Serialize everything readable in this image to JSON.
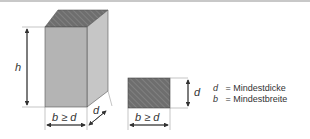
{
  "diagram": {
    "labels": {
      "height": "h",
      "width_front": "b ≥ d",
      "depth": "d",
      "section_depth": "d",
      "section_width": "b ≥ d"
    },
    "legend": [
      {
        "symbol": "d",
        "text": "= Mindestdicke"
      },
      {
        "symbol": "b",
        "text": "= Mindestbreite"
      }
    ],
    "colors": {
      "front_face": "#b4b4b4",
      "side_face": "#c4c4c4",
      "hatch_fill": "#6e6e6e",
      "hatch_lines": "#8a8a8a",
      "lines": "#333333"
    }
  }
}
